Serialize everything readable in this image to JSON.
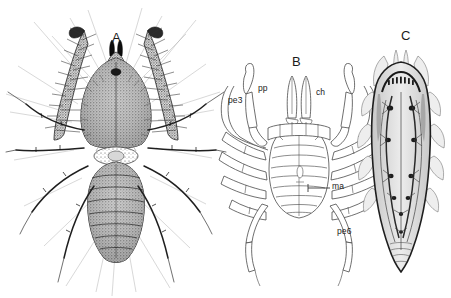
{
  "figure": {
    "background_color": "#ffffff",
    "ink_color": "#1b1b1b",
    "line_color": "#4a4a4a",
    "shade_color": "#b9b9b9",
    "width": 451,
    "height": 298
  },
  "panels": [
    {
      "id": "A",
      "label": "A",
      "name": "panel-a-habitus-photograph",
      "label_x": 112,
      "label_y": 30,
      "description": "ventral habitus, stippled halftone"
    },
    {
      "id": "B",
      "label": "B",
      "name": "panel-b-line-drawing",
      "label_x": 292,
      "label_y": 54,
      "description": "ventral line drawing with anatomical labels"
    },
    {
      "id": "C",
      "label": "C",
      "name": "panel-c-internal-view",
      "label_x": 401,
      "label_y": 28,
      "description": "shaded dorsal internal view"
    }
  ],
  "anatomical_labels": [
    {
      "key": "pe3",
      "text": "pe3",
      "x": 228,
      "y": 95,
      "leader": false
    },
    {
      "key": "pp",
      "text": "pp",
      "x": 258,
      "y": 83,
      "leader": false
    },
    {
      "key": "ch",
      "text": "ch",
      "x": 316,
      "y": 87,
      "leader": false
    },
    {
      "key": "ma",
      "text": "ma",
      "x": 332,
      "y": 186,
      "leader": true,
      "leader_x1": 310,
      "leader_y1": 188,
      "leader_x2": 330,
      "leader_y2": 188
    },
    {
      "key": "pe6",
      "text": "pe6",
      "x": 337,
      "y": 231,
      "leader": false
    }
  ]
}
